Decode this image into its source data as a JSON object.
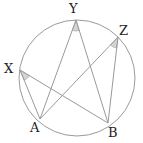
{
  "diagram": {
    "type": "inscribed-angles-circle",
    "circle": {
      "cx": 77,
      "cy": 78,
      "r": 58,
      "stroke": "#9a9a9a"
    },
    "points": {
      "X": {
        "label": "X",
        "x": 20,
        "y": 70,
        "lx": 4,
        "ly": 73
      },
      "Y": {
        "label": "Y",
        "x": 76,
        "y": 20,
        "lx": 69,
        "ly": 13
      },
      "Z": {
        "label": "Z",
        "x": 118,
        "y": 37,
        "lx": 119,
        "ly": 35
      },
      "A": {
        "label": "A",
        "x": 40,
        "y": 119,
        "lx": 30,
        "ly": 132
      },
      "B": {
        "label": "B",
        "x": 108,
        "y": 123,
        "lx": 108,
        "ly": 137
      }
    },
    "segments": [
      [
        "X",
        "A"
      ],
      [
        "X",
        "B"
      ],
      [
        "Y",
        "A"
      ],
      [
        "Y",
        "B"
      ],
      [
        "Z",
        "A"
      ],
      [
        "Z",
        "B"
      ]
    ],
    "angle_marks": [
      "X",
      "Y",
      "Z"
    ],
    "line_color": "#9a9a9a",
    "angle_fill": "#d4d4d4"
  }
}
